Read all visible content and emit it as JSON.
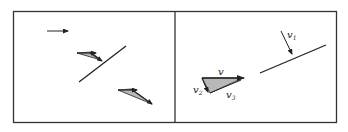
{
  "figure": {
    "panels": [
      {
        "id": "left",
        "description": "Incoming arrow and velocity triangles on both sides of an oblique line"
      },
      {
        "id": "right",
        "description": "Velocity decomposition triangle and incident vector on an oblique line",
        "labels": {
          "v": "v",
          "v1": "v",
          "v1_sub": "1",
          "v2": "v",
          "v2_sub": "2",
          "v3": "v",
          "v3_sub": "3"
        }
      }
    ],
    "colors": {
      "stroke": "#222222",
      "fill": "#b8b8b8",
      "border": "#333333"
    }
  }
}
